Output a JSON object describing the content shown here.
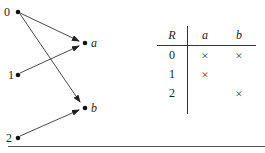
{
  "graph": {
    "left_nodes": [
      {
        "label": "0",
        "x": 18,
        "y": 12
      },
      {
        "label": "1",
        "x": 18,
        "y": 75
      },
      {
        "label": "2",
        "x": 18,
        "y": 138
      }
    ],
    "right_nodes": [
      {
        "label": "a",
        "x": 85,
        "y": 43
      },
      {
        "label": "b",
        "x": 85,
        "y": 108
      }
    ],
    "edges": [
      {
        "from": "0",
        "to": "a"
      },
      {
        "from": "0",
        "to": "b"
      },
      {
        "from": "1",
        "to": "a"
      },
      {
        "from": "2",
        "to": "b"
      }
    ]
  },
  "table": {
    "corner": "R",
    "columns": [
      "a",
      "b"
    ],
    "rows": [
      {
        "label": "0",
        "cells": [
          "×",
          "×"
        ]
      },
      {
        "label": "1",
        "cells": [
          "×",
          ""
        ]
      },
      {
        "label": "2",
        "cells": [
          "",
          "×"
        ]
      }
    ]
  }
}
